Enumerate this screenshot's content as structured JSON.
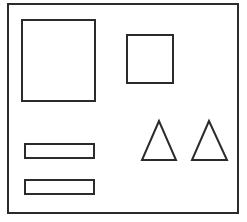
{
  "diagram": {
    "background": "#ffffff",
    "stroke": "#2b2b2b",
    "frame": {
      "x": 8,
      "y": 4,
      "w": 230,
      "h": 209
    },
    "shapes": [
      {
        "type": "rect",
        "name": "large-rectangle",
        "x": 22,
        "y": 20,
        "w": 73,
        "h": 81
      },
      {
        "type": "rect",
        "name": "small-square",
        "x": 127,
        "y": 35,
        "w": 46,
        "h": 48
      },
      {
        "type": "rect",
        "name": "bar-top",
        "x": 25,
        "y": 144,
        "w": 69,
        "h": 14
      },
      {
        "type": "rect",
        "name": "bar-bottom",
        "x": 25,
        "y": 180,
        "w": 69,
        "h": 14
      },
      {
        "type": "triangle",
        "name": "triangle-left",
        "points": "159,121 142,160 176,160"
      },
      {
        "type": "triangle",
        "name": "triangle-right",
        "points": "209,121 192,160 227,160"
      }
    ]
  }
}
